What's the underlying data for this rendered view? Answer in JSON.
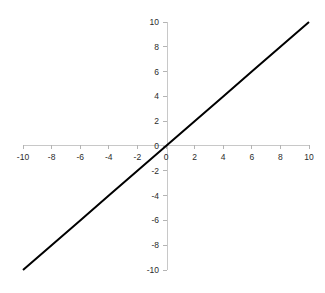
{
  "chart_data": {
    "type": "line",
    "title": "",
    "subtitle": "",
    "xlabel": "",
    "ylabel": "",
    "xlim": [
      -10,
      10
    ],
    "ylim": [
      -10,
      10
    ],
    "grid": false,
    "legend": null,
    "legend_position": "none",
    "x_ticks": [
      -10,
      -8,
      -6,
      -4,
      -2,
      0,
      2,
      4,
      6,
      8,
      10
    ],
    "y_ticks": [
      -10,
      -8,
      -6,
      -4,
      -2,
      0,
      2,
      4,
      6,
      8,
      10
    ],
    "x_tick_labels": [
      "-10",
      "-8",
      "-6",
      "-4",
      "-2",
      "0",
      "2",
      "4",
      "6",
      "8",
      "10"
    ],
    "y_tick_labels": [
      "-10",
      "-8",
      "-6",
      "-4",
      "-2",
      "0",
      "2",
      "4",
      "6",
      "8",
      "10"
    ],
    "series": [
      {
        "name": "y = x",
        "color": "#000000",
        "line_width": 2,
        "x": [
          -10,
          -8,
          -6,
          -4,
          -2,
          0,
          2,
          4,
          6,
          8,
          10
        ],
        "values": [
          -10,
          -8,
          -6,
          -4,
          -2,
          0,
          2,
          4,
          6,
          8,
          10
        ]
      }
    ],
    "annotations": []
  },
  "style": {
    "background_color": "#ffffff",
    "axis_color": "#c8c8c8",
    "tick_color": "#b4b4b4",
    "label_color": "#2b2b2b",
    "line_color": "#000000"
  }
}
